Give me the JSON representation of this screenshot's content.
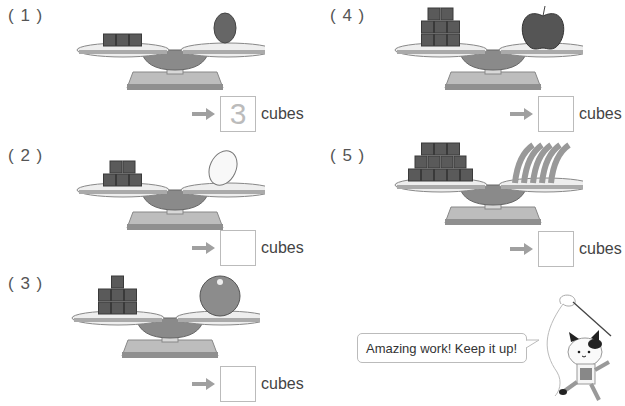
{
  "problems": [
    {
      "label": "( 1 )",
      "left_item": "cubes",
      "left_cube_count": 3,
      "right_item": "mango",
      "answer": "3",
      "unit": "cubes"
    },
    {
      "label": "( 2 )",
      "left_item": "cubes",
      "left_cube_count": 5,
      "right_item": "lemon",
      "answer": "",
      "unit": "cubes"
    },
    {
      "label": "( 3 )",
      "left_item": "cubes",
      "left_cube_count": 7,
      "right_item": "orange",
      "answer": "",
      "unit": "cubes"
    },
    {
      "label": "( 4 )",
      "left_item": "cubes",
      "left_cube_count": 8,
      "right_item": "apple",
      "answer": "",
      "unit": "cubes"
    },
    {
      "label": "( 5 )",
      "left_item": "cubes",
      "left_cube_count": 12,
      "right_item": "bananas",
      "answer": "",
      "unit": "cubes"
    }
  ],
  "speech_bubble": {
    "text": "Amazing work! Keep it up!"
  },
  "mascot": {
    "icon": "cat-with-ribbon-icon"
  },
  "colors": {
    "cube": "#5a5a5a",
    "arrow": "#a0a0a0",
    "box_border": "#bbbbbb",
    "answer_text": "#bbbbbb"
  }
}
